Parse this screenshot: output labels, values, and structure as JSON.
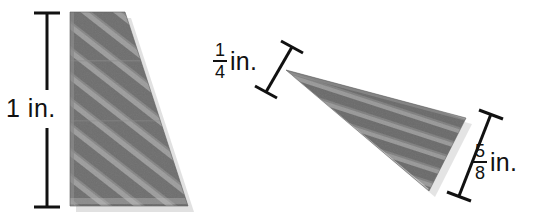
{
  "figure": {
    "background_color": "#ffffff",
    "shape_fill_color": "#6f6f6f",
    "shape_stripe_color": "#b9b9b9",
    "line_color": "#111111",
    "shapes": [
      {
        "name": "left-trapezoid",
        "description": "Vertical-left-edge trapezoid, narrow top, wide bottom",
        "points": "70,12 125,12 188,206 70,206"
      },
      {
        "name": "right-triangle-wedge",
        "description": "Tilted thin triangular wedge pointing left",
        "points": "286,70 466,118 429,191"
      }
    ],
    "dimensions": [
      {
        "name": "height-dimension",
        "value": "1 in.",
        "whole": "1",
        "unit": "in.",
        "orientation": "vertical",
        "line": {
          "x1": 47,
          "y1": 14,
          "x2": 47,
          "y2": 206
        }
      },
      {
        "name": "short-edge-dimension",
        "value": "1/4 in.",
        "numerator": "1",
        "denominator": "4",
        "unit": "in.",
        "orientation": "diagonal",
        "line": {
          "x1": 292,
          "y1": 47,
          "x2": 266,
          "y2": 92
        }
      },
      {
        "name": "long-edge-dimension",
        "value": "5/8 in.",
        "numerator": "5",
        "denominator": "8",
        "unit": "in.",
        "orientation": "diagonal",
        "line": {
          "x1": 491,
          "y1": 114,
          "x2": 459,
          "y2": 196
        }
      }
    ]
  }
}
